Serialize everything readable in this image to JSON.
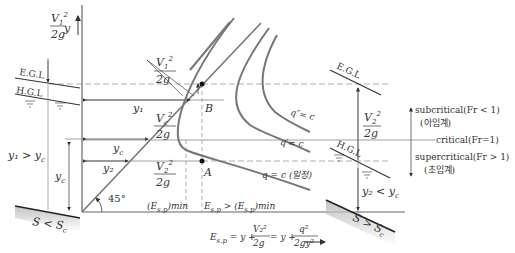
{
  "axis": {
    "y_label": "y",
    "angle_label": "45°"
  },
  "left": {
    "egl": "E.G.L",
    "hgl": "H.G.L",
    "velocity_head": {
      "num": "V",
      "sub": "1",
      "sup": "2",
      "den": "2g"
    },
    "depth_relation": "y₁ > y",
    "depth_relation_sub": "c",
    "yc_label": "y",
    "yc_sub": "c",
    "slope": "S < S",
    "slope_sub": "c"
  },
  "center": {
    "y1": "y₁",
    "yc": "y",
    "yc_sub": "c",
    "y2": "y₂",
    "vh1_top": {
      "num": "V",
      "sub": "1",
      "sup": "2",
      "den": "2g"
    },
    "vh_c": {
      "num": "V",
      "sub": "c",
      "sup": "2",
      "den": "2g"
    },
    "vh2": {
      "num": "V",
      "sub": "2",
      "sup": "2",
      "den": "2g"
    },
    "point_b": "B",
    "point_a": "A",
    "e_min": "(E",
    "e_min_sub": "s.p",
    "e_min_tail": ")min",
    "e_gt": "E",
    "e_gt_sub": "s.p",
    "e_gt_mid": " > (E",
    "e_gt_sub2": "s.p",
    "e_gt_tail": ")min",
    "curves": [
      "q″= c",
      "q′= c",
      "q = c (일정)"
    ],
    "equation_lhs": "E",
    "equation_lhs_sub": "s.p",
    "equation_mid": " = y + ",
    "eq_frac1_num": "V₂²",
    "eq_frac1_den": "2g",
    "eq_mid2": " = y + ",
    "eq_frac2_num": "q²",
    "eq_frac2_den": "2gy²"
  },
  "right": {
    "egl": "E.G.L",
    "hgl": "H.G.L",
    "velocity_head": {
      "num": "V",
      "sub": "2",
      "sup": "2",
      "den": "2g"
    },
    "depth_relation": "y₂ < y",
    "depth_relation_sub": "c",
    "slope": "S > S",
    "slope_sub": "c"
  },
  "legend": {
    "subcritical": "subcritical(Fr < 1)",
    "subcritical_ko": "(아임계)",
    "critical": "critical(Fr=1)",
    "supercritical": "supercritical(Fr > 1)",
    "supercritical_ko": "(초임계)"
  },
  "colors": {
    "line": "#333333",
    "curve": "#7a7a7a",
    "dash": "#999999",
    "grid": "#888888"
  }
}
